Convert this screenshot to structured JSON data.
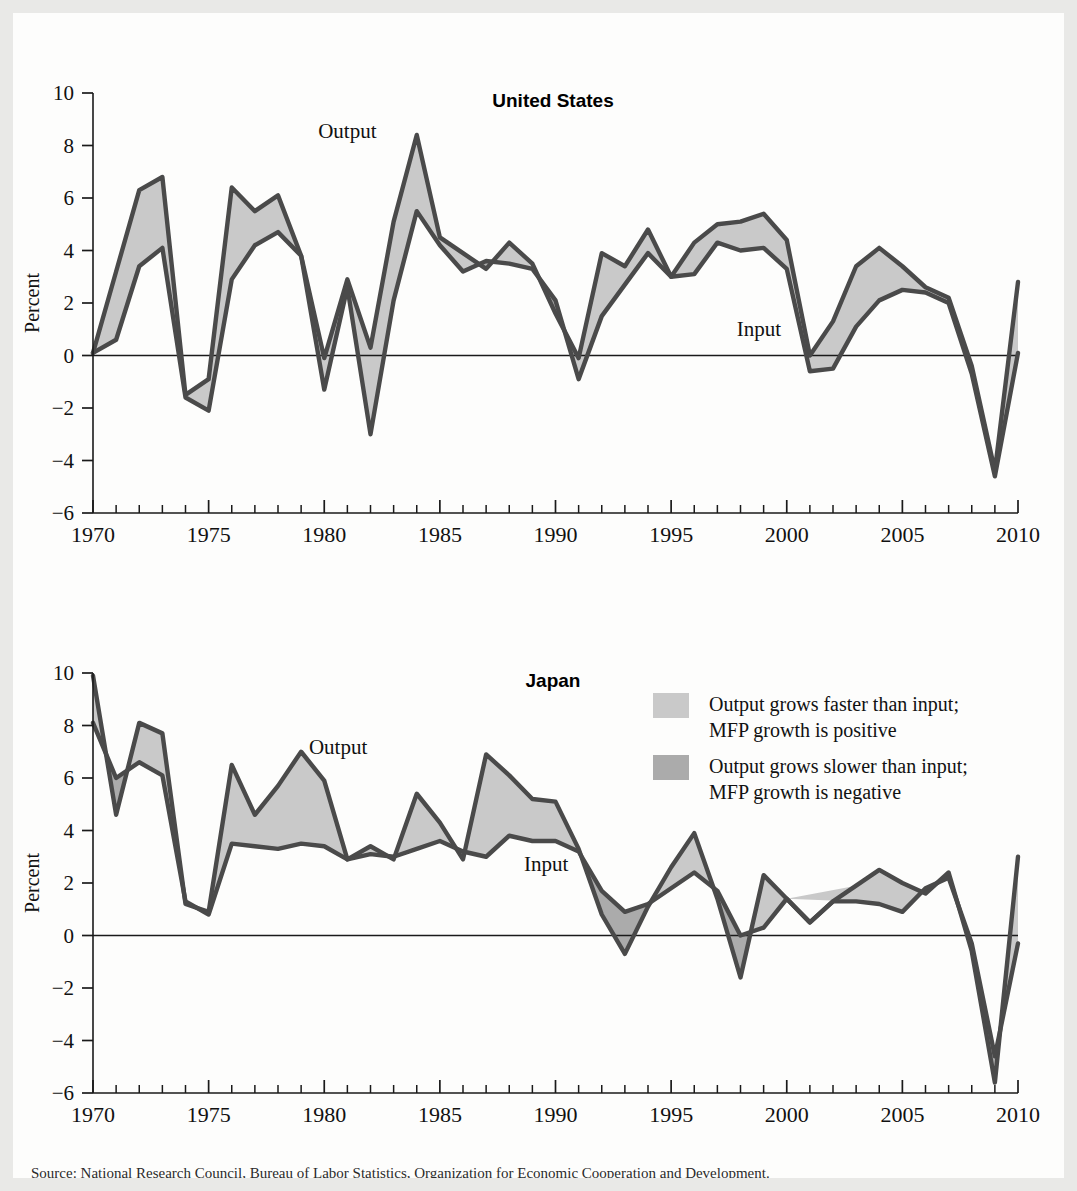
{
  "figure": {
    "ylabel": "Percent",
    "legend": [
      {
        "swatch_color": "#c9c9c9",
        "line1": "Output grows faster than input;",
        "line2": "MFP growth is positive"
      },
      {
        "swatch_color": "#ababab",
        "line1": "Output grows slower than input;",
        "line2": "MFP growth is negative"
      }
    ],
    "caption": "Source: National Research Council, Bureau of Labor Statistics, Organization for Economic Cooperation and Development."
  },
  "chart_data": [
    {
      "type": "area",
      "title": "United States",
      "xlabel": "",
      "ylabel": "Percent",
      "xlim": [
        1970,
        2010
      ],
      "ylim": [
        -6,
        10
      ],
      "yticks": [
        10,
        8,
        6,
        4,
        2,
        0,
        -2,
        -4,
        -6
      ],
      "ytick_labels": [
        "10",
        "8",
        "6",
        "4",
        "2",
        "0",
        "−2",
        "−4",
        "−6"
      ],
      "xticks": [
        1970,
        1975,
        1980,
        1985,
        1990,
        1995,
        2000,
        2005,
        2010
      ],
      "xtick_labels": [
        "1970",
        "1975",
        "1980",
        "1985",
        "1990",
        "1995",
        "2000",
        "2005",
        "2010"
      ],
      "grid": false,
      "legend_position": "outside-right",
      "annotations": [
        {
          "text": "Output",
          "x": 1981.0,
          "y": 8.3
        },
        {
          "text": "Input",
          "x": 1998.8,
          "y": 0.75
        }
      ],
      "x": [
        1970,
        1971,
        1972,
        1973,
        1974,
        1975,
        1976,
        1977,
        1978,
        1979,
        1980,
        1981,
        1982,
        1983,
        1984,
        1985,
        1986,
        1987,
        1988,
        1989,
        1990,
        1991,
        1992,
        1993,
        1994,
        1995,
        1996,
        1997,
        1998,
        1999,
        2000,
        2001,
        2002,
        2003,
        2004,
        2005,
        2006,
        2007,
        2008,
        2009,
        2010
      ],
      "series": [
        {
          "name": "Output",
          "values": [
            0.1,
            3.2,
            6.3,
            6.8,
            -1.5,
            -0.9,
            6.4,
            5.5,
            6.1,
            3.8,
            -0.1,
            2.9,
            0.3,
            5.1,
            8.4,
            4.5,
            3.9,
            3.3,
            4.3,
            3.5,
            1.6,
            -0.1,
            3.9,
            3.4,
            4.8,
            3.0,
            4.3,
            5.0,
            5.1,
            5.4,
            4.4,
            0.0,
            1.3,
            3.4,
            4.1,
            3.4,
            2.6,
            2.2,
            -0.4,
            -4.4,
            2.8
          ]
        },
        {
          "name": "Input",
          "values": [
            0.1,
            0.6,
            3.4,
            4.1,
            -1.6,
            -2.1,
            2.9,
            4.2,
            4.7,
            3.8,
            -1.3,
            2.6,
            -3.0,
            2.1,
            5.5,
            4.2,
            3.2,
            3.6,
            3.5,
            3.3,
            2.1,
            -0.9,
            1.5,
            2.7,
            3.9,
            3.0,
            3.1,
            4.3,
            4.0,
            4.1,
            3.3,
            -0.6,
            -0.5,
            1.1,
            2.1,
            2.5,
            2.4,
            2.0,
            -0.7,
            -4.6,
            0.1
          ]
        }
      ]
    },
    {
      "type": "area",
      "title": "Japan",
      "xlabel": "",
      "ylabel": "Percent",
      "xlim": [
        1970,
        2010
      ],
      "ylim": [
        -6,
        10
      ],
      "yticks": [
        10,
        8,
        6,
        4,
        2,
        0,
        -2,
        -4,
        -6
      ],
      "ytick_labels": [
        "10",
        "8",
        "6",
        "4",
        "2",
        "0",
        "−2",
        "−4",
        "−6"
      ],
      "xticks": [
        1970,
        1975,
        1980,
        1985,
        1990,
        1995,
        2000,
        2005,
        2010
      ],
      "xtick_labels": [
        "1970",
        "1975",
        "1980",
        "1985",
        "1990",
        "1995",
        "2000",
        "2005",
        "2010"
      ],
      "grid": false,
      "legend_position": "outside-right",
      "annotations": [
        {
          "text": "Output",
          "x": 1980.6,
          "y": 6.9
        },
        {
          "text": "Input",
          "x": 1989.6,
          "y": 2.45
        }
      ],
      "x": [
        1970,
        1971,
        1972,
        1973,
        1974,
        1975,
        1976,
        1977,
        1978,
        1979,
        1980,
        1981,
        1982,
        1983,
        1984,
        1985,
        1986,
        1987,
        1988,
        1989,
        1990,
        1991,
        1992,
        1993,
        1994,
        1995,
        1996,
        1997,
        1998,
        1999,
        2000,
        2001,
        2002,
        2003,
        2004,
        2005,
        2006,
        2007,
        2008,
        2009,
        2010
      ],
      "series": [
        {
          "name": "Output",
          "values": [
            9.9,
            4.6,
            8.1,
            7.7,
            1.2,
            0.9,
            6.5,
            4.6,
            5.7,
            7.0,
            5.9,
            2.9,
            3.4,
            2.9,
            5.4,
            4.3,
            2.9,
            6.9,
            6.1,
            5.2,
            5.1,
            3.3,
            0.8,
            -0.7,
            1.1,
            2.6,
            3.9,
            1.4,
            -1.6,
            2.3,
            1.4,
            0.5,
            1.3,
            1.9,
            2.5,
            2.0,
            1.6,
            2.4,
            -0.6,
            -5.6,
            3.0
          ]
        },
        {
          "name": "Input",
          "values": [
            8.1,
            6.0,
            6.6,
            6.1,
            1.3,
            0.8,
            3.5,
            3.4,
            3.3,
            3.5,
            3.4,
            2.9,
            3.1,
            3.0,
            3.3,
            3.6,
            3.2,
            3.0,
            3.8,
            3.6,
            3.6,
            3.2,
            1.7,
            0.9,
            1.2,
            1.8,
            2.4,
            1.7,
            0.0,
            0.3,
            1.4,
            0.5,
            1.3,
            1.3,
            1.2,
            0.9,
            1.8,
            2.2,
            -0.3,
            -4.6,
            -0.3
          ]
        }
      ]
    }
  ]
}
